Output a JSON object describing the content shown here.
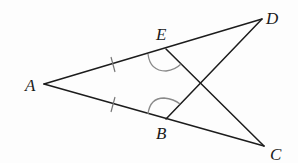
{
  "figure": {
    "points": {
      "A": {
        "label": "A",
        "x": 44,
        "y": 84,
        "label_x": 25,
        "label_y": 91
      },
      "E": {
        "label": "E",
        "x": 166,
        "y": 49,
        "label_x": 156,
        "label_y": 40
      },
      "D": {
        "label": "D",
        "x": 262,
        "y": 19,
        "label_x": 266,
        "label_y": 24
      },
      "B": {
        "label": "B",
        "x": 166,
        "y": 119,
        "label_x": 156,
        "label_y": 139
      },
      "C": {
        "label": "C",
        "x": 264,
        "y": 146,
        "label_x": 270,
        "label_y": 160
      }
    },
    "segments": [
      {
        "name": "segment-AD",
        "from": "A",
        "to": "D"
      },
      {
        "name": "segment-AC",
        "from": "A",
        "to": "C"
      },
      {
        "name": "segment-EC",
        "from": "E",
        "to": "C"
      },
      {
        "name": "segment-BD",
        "from": "B",
        "to": "D"
      }
    ],
    "equal_length_marks": [
      "AE",
      "AB"
    ],
    "equal_angle_marks": [
      "angle-AEC",
      "angle-ABD"
    ],
    "colors": {
      "line": "#1c1c1c",
      "mark": "#8a8a8a",
      "text": "#1a1a1a"
    }
  }
}
